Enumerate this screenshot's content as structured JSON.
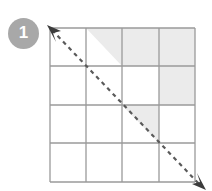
{
  "figure": {
    "badge": {
      "label": "1",
      "fill_color": "#a8a8a8",
      "text_color": "#ffffff"
    },
    "grid": {
      "rows": 4,
      "cols": 4,
      "left": 50,
      "top": 28,
      "right": 195,
      "bottom": 182,
      "line_color": "#9a9a9a",
      "cell_fill_empty": "#ffffff",
      "cell_fill_shaded": "#ebebeb",
      "x_lines": [
        50,
        86,
        122,
        159,
        195
      ],
      "y_lines": [
        28,
        66,
        105,
        143,
        182
      ],
      "cells": [
        [
          {
            "row": 1,
            "col": 1,
            "shading": "none"
          },
          {
            "row": 1,
            "col": 2,
            "shading": "upper-right-triangle"
          },
          {
            "row": 1,
            "col": 3,
            "shading": "full"
          },
          {
            "row": 1,
            "col": 4,
            "shading": "full"
          }
        ],
        [
          {
            "row": 2,
            "col": 1,
            "shading": "none"
          },
          {
            "row": 2,
            "col": 2,
            "shading": "none"
          },
          {
            "row": 2,
            "col": 3,
            "shading": "none"
          },
          {
            "row": 2,
            "col": 4,
            "shading": "full"
          }
        ],
        [
          {
            "row": 3,
            "col": 1,
            "shading": "none"
          },
          {
            "row": 3,
            "col": 2,
            "shading": "none"
          },
          {
            "row": 3,
            "col": 3,
            "shading": "upper-right-triangle"
          },
          {
            "row": 3,
            "col": 4,
            "shading": "none"
          }
        ],
        [
          {
            "row": 4,
            "col": 1,
            "shading": "none"
          },
          {
            "row": 4,
            "col": 2,
            "shading": "none"
          },
          {
            "row": 4,
            "col": 3,
            "shading": "none"
          },
          {
            "row": 4,
            "col": 4,
            "shading": "none"
          }
        ]
      ]
    },
    "diagonal_arrow": {
      "style": "dashed",
      "color": "#5a5a5a",
      "start_x": 49,
      "start_y": 27,
      "end_x": 203,
      "end_y": 188,
      "arrowhead_start": true,
      "arrowhead_end": true,
      "dash_pattern": "4 4",
      "stroke_width": 2.2
    }
  }
}
